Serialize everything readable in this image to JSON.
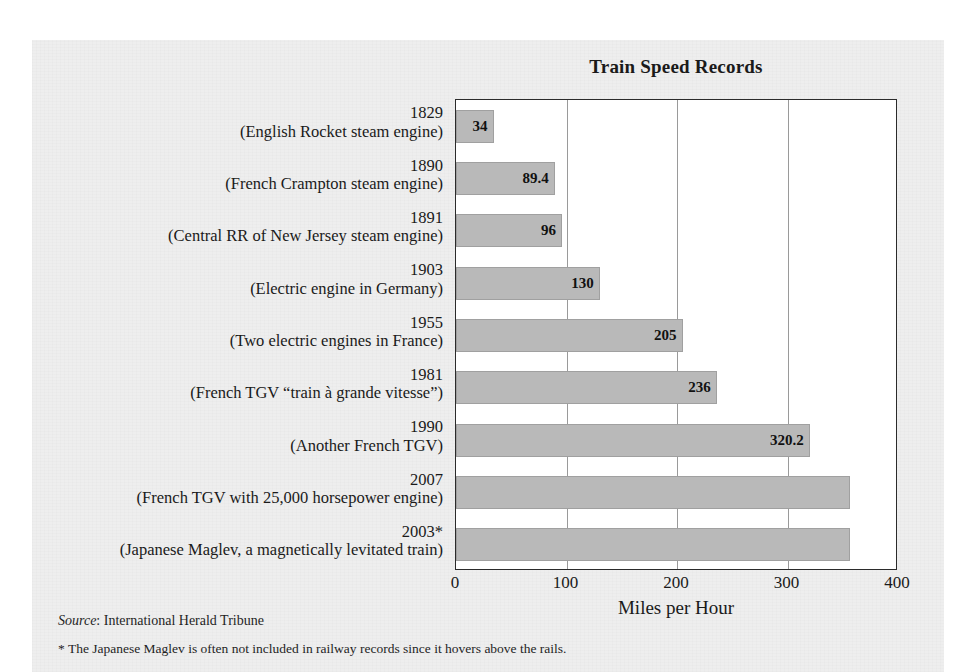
{
  "chart_data": {
    "type": "bar",
    "orientation": "horizontal",
    "title": "Train Speed Records",
    "xlabel": "Miles per Hour",
    "ylabel": "",
    "xlim": [
      0,
      400
    ],
    "xticks": [
      0,
      100,
      200,
      300,
      400
    ],
    "xtick_labels": [
      "0",
      "100",
      "200",
      "300",
      "400"
    ],
    "grid": true,
    "legend": "none",
    "bar_color": "#b9b9b9",
    "categories": [
      "1829 (English Rocket steam engine)",
      "1890 (French Crampton steam engine)",
      "1891 (Central RR of New Jersey steam engine)",
      "1903 (Electric engine in Germany)",
      "1955 (Two electric engines in France)",
      "1981 (French TGV “train à grande vitesse”)",
      "1990 (Another French TGV)",
      "2007 (French TGV with 25,000 horsepower engine)",
      "2003* (Japanese Maglev, a magnetically levitated train)"
    ],
    "values": [
      34,
      89.4,
      96,
      130,
      205,
      236,
      320.2,
      357,
      357
    ],
    "bars": [
      {
        "year": "1829",
        "desc": "(English Rocket steam engine)",
        "value": 34,
        "label": "34"
      },
      {
        "year": "1890",
        "desc": "(French Crampton steam engine)",
        "value": 89.4,
        "label": "89.4"
      },
      {
        "year": "1891",
        "desc": "(Central RR of New Jersey steam engine)",
        "value": 96,
        "label": "96"
      },
      {
        "year": "1903",
        "desc": "(Electric engine in Germany)",
        "value": 130,
        "label": "130"
      },
      {
        "year": "1955",
        "desc": "(Two electric engines in France)",
        "value": 205,
        "label": "205"
      },
      {
        "year": "1981",
        "desc": "(French TGV “train à grande vitesse”)",
        "value": 236,
        "label": "236"
      },
      {
        "year": "1990",
        "desc": "(Another French TGV)",
        "value": 320.2,
        "label": "320.2"
      },
      {
        "year": "2007",
        "desc": "(French TGV with 25,000 horsepower engine)",
        "value": 357,
        "label": ""
      },
      {
        "year": "2003*",
        "desc": "(Japanese Maglev, a magnetically levitated train)",
        "value": 357,
        "label": ""
      }
    ]
  },
  "notes": {
    "source_word": "Source",
    "source_text": ": International Herald Tribune",
    "footnote": "* The Japanese Maglev is often not included in railway records since it hovers above the rails."
  }
}
